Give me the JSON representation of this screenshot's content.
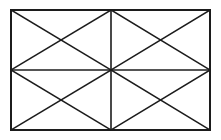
{
  "figure": {
    "shape_type": "line-diagram",
    "background_color": "#ffffff",
    "line_color": "#1c1c1c",
    "canvas": {
      "width": 221,
      "height": 140
    },
    "outer_rectangle": {
      "label": "Outer rectangle",
      "left": 11,
      "top": 10,
      "right": 210,
      "bottom": 130,
      "width": 199,
      "height": 120,
      "stroke_width": 2
    },
    "grid": {
      "columns": 2,
      "rows": 2,
      "cell_count": 4,
      "vertical_midline_x": 111,
      "horizontal_midline_y": 70,
      "stroke_width": 1.6
    },
    "vertices": {
      "top_left": {
        "label": "Top left corner",
        "x": 11,
        "y": 10
      },
      "top_mid": {
        "label": "Top midpoint",
        "x": 111,
        "y": 10
      },
      "top_right": {
        "label": "Top right corner",
        "x": 210,
        "y": 10
      },
      "mid_left": {
        "label": "Left midpoint",
        "x": 11,
        "y": 70
      },
      "center": {
        "label": "Center point",
        "x": 111,
        "y": 70
      },
      "mid_right": {
        "label": "Right midpoint",
        "x": 210,
        "y": 70
      },
      "bottom_left": {
        "label": "Bottom left corner",
        "x": 11,
        "y": 130
      },
      "bottom_mid": {
        "label": "Bottom midpoint",
        "x": 111,
        "y": 130
      },
      "bottom_right": {
        "label": "Bottom right corner",
        "x": 210,
        "y": 130
      }
    },
    "cells": [
      {
        "name": "top-left-cell",
        "label": "Top left cell",
        "x1": 11,
        "y1": 10,
        "x2": 111,
        "y2": 70,
        "diagonals": [
          "11,10 to 111,70",
          "111,10 to 11,70"
        ],
        "diagonal_crossing": {
          "x": 61,
          "y": 40
        }
      },
      {
        "name": "top-right-cell",
        "label": "Top right cell",
        "x1": 111,
        "y1": 10,
        "x2": 210,
        "y2": 70,
        "diagonals": [
          "111,10 to 210,70",
          "210,10 to 111,70"
        ],
        "diagonal_crossing": {
          "x": 160.5,
          "y": 40
        }
      },
      {
        "name": "bottom-left-cell",
        "label": "Bottom left cell",
        "x1": 11,
        "y1": 70,
        "x2": 111,
        "y2": 130,
        "diagonals": [
          "11,70 to 111,130",
          "111,70 to 11,130"
        ],
        "diagonal_crossing": {
          "x": 61,
          "y": 100
        }
      },
      {
        "name": "bottom-right-cell",
        "label": "Bottom right cell",
        "x1": 111,
        "y1": 70,
        "x2": 210,
        "y2": 130,
        "diagonals": [
          "111,70 to 210,130",
          "210,70 to 111,130"
        ],
        "diagonal_crossing": {
          "x": 160.5,
          "y": 100
        }
      }
    ],
    "counts": {
      "rectangle_cells": 4,
      "diagonal_segments": 8,
      "small_triangles": 16,
      "interior_grid_lines": 2
    }
  }
}
